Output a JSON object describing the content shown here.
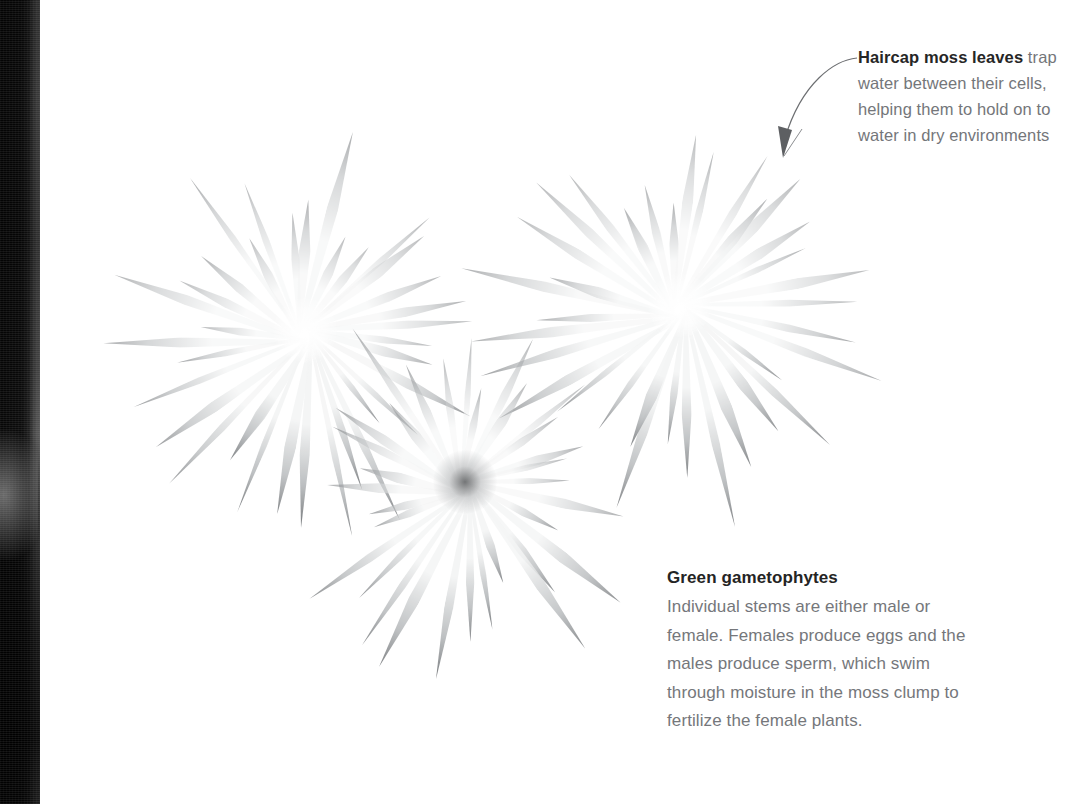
{
  "page": {
    "width": 1073,
    "height": 804,
    "background": "#ffffff",
    "kind": "book-page-photograph"
  },
  "gutter": {
    "name": "book-spine-shadow",
    "width_px": 40,
    "color_dark": "#0b0b0b",
    "color_mid": "#3a3a3a"
  },
  "photo": {
    "alt": "Three pale star-shaped haircap moss rosettes with radiating pointed leaves on a white background",
    "rosettes": [
      {
        "id": "left",
        "cx": 265,
        "cy": 330,
        "radius": 215,
        "leaves": 34,
        "rotation": 8
      },
      {
        "id": "right",
        "cx": 640,
        "cy": 305,
        "radius": 225,
        "leaves": 34,
        "rotation": 22
      },
      {
        "id": "bottom",
        "cx": 425,
        "cy": 482,
        "radius": 205,
        "leaves": 32,
        "rotation": 14
      }
    ],
    "leaf_color_light": "#f4f5f5",
    "leaf_color_shadow": "#b8bbbd",
    "leaf_color_tip": "#6e7174"
  },
  "callouts": {
    "top": {
      "name": "haircap-moss-leaves-callout",
      "bold_lead": "Haircap moss leaves",
      "rest": " trap water between their cells, helping them to hold on to water in dry environments",
      "full_text": "Haircap moss leaves trap water between their cells, helping them to hold on to water in dry environments",
      "heading_color": "#262626",
      "body_color": "#74767a"
    },
    "bottom": {
      "name": "green-gametophytes-callout",
      "heading": "Green gametophytes",
      "body": "Individual stems are either male or female. Females produce eggs and the males produce sperm, which swim through moisture in the moss clump to fertilize the female plants.",
      "heading_color": "#242424",
      "body_color": "#75777b"
    }
  },
  "leader_line": {
    "name": "callout-leader-arrow",
    "color": "#6d6f72",
    "from": [
      855,
      58
    ],
    "to": [
      783,
      155
    ],
    "arrowhead": "down"
  }
}
